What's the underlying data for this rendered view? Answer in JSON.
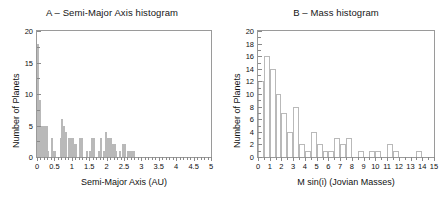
{
  "figure": {
    "width": 448,
    "height": 209,
    "background": "#ffffff",
    "bar_edge_color": "#b9b9b9",
    "axis_color": "#9a9a9a"
  },
  "chart_data": [
    {
      "type": "bar",
      "panel": "A",
      "title": "A – Semi-Major Axis histogram",
      "xlabel": "Semi-Major Axis (AU)",
      "ylabel": "Number of Planets",
      "xlim": [
        0,
        5
      ],
      "ylim": [
        0,
        20
      ],
      "bin_width": 0.05,
      "grid": false,
      "xticks": [
        0,
        0.5,
        1,
        1.5,
        2,
        2.5,
        3,
        3.5,
        4,
        4.5,
        5
      ],
      "xticklabels": [
        "0",
        "0.5",
        "1",
        "1.5",
        "2",
        "2.5",
        "3",
        "3.5",
        "4",
        "4.5",
        "5"
      ],
      "yticks": [
        0,
        5,
        10,
        15,
        20
      ],
      "yticklabels": [
        "0",
        "5",
        "10",
        "15",
        "20"
      ],
      "bin_starts": [
        0.0,
        0.05,
        0.1,
        0.15,
        0.2,
        0.25,
        0.3,
        0.35,
        0.4,
        0.45,
        0.5,
        0.55,
        0.6,
        0.65,
        0.7,
        0.75,
        0.8,
        0.85,
        0.9,
        0.95,
        1.0,
        1.05,
        1.1,
        1.15,
        1.2,
        1.25,
        1.3,
        1.35,
        1.4,
        1.45,
        1.5,
        1.55,
        1.6,
        1.65,
        1.7,
        1.75,
        1.8,
        1.85,
        1.9,
        1.95,
        2.0,
        2.05,
        2.1,
        2.15,
        2.2,
        2.25,
        2.3,
        2.35,
        2.4,
        2.45,
        2.5,
        2.55,
        2.6,
        2.65,
        2.7,
        2.75,
        2.8,
        2.85,
        2.9,
        2.95,
        3.0,
        3.05,
        3.1,
        3.15,
        3.2,
        3.25,
        3.3,
        3.35,
        3.4,
        3.45,
        3.5,
        3.55,
        3.6,
        3.65
      ],
      "values": [
        18,
        9,
        5,
        5,
        5,
        5,
        1,
        0,
        3,
        1,
        1,
        0,
        0,
        3,
        6,
        5,
        4,
        0,
        3,
        3,
        3,
        2,
        2,
        0,
        3,
        3,
        0,
        0,
        1,
        0,
        1,
        3,
        3,
        0,
        0,
        1,
        3,
        0,
        1,
        4,
        3,
        3,
        3,
        2,
        2,
        1,
        0,
        1,
        0,
        2,
        2,
        0,
        1,
        1,
        1,
        1,
        0,
        0,
        0,
        0,
        0,
        0,
        0,
        0,
        0,
        0,
        0,
        0,
        0,
        0,
        0,
        0,
        0,
        0
      ],
      "peak_value": 18,
      "peak_bin": "0.00–0.05"
    },
    {
      "type": "bar",
      "panel": "B",
      "title": "B – Mass histogram",
      "xlabel": "M sin(i) (Jovian Masses)",
      "ylabel": "Number of Planets",
      "xlim": [
        0,
        15
      ],
      "ylim": [
        0,
        20
      ],
      "bin_width": 0.5,
      "grid": false,
      "xticks": [
        0,
        1,
        2,
        3,
        4,
        5,
        6,
        7,
        8,
        9,
        10,
        11,
        12,
        13,
        14,
        15
      ],
      "xticklabels": [
        "0",
        "1",
        "2",
        "3",
        "4",
        "5",
        "6",
        "7",
        "8",
        "9",
        "10",
        "11",
        "12",
        "13",
        "14",
        "15"
      ],
      "yticks": [
        0,
        2,
        4,
        6,
        8,
        10,
        12,
        14,
        16,
        18,
        20
      ],
      "yticklabels": [
        "0",
        "2",
        "4",
        "6",
        "8",
        "10",
        "12",
        "14",
        "16",
        "18",
        "20"
      ],
      "bin_starts": [
        0.0,
        0.5,
        1.0,
        1.5,
        2.0,
        2.5,
        3.0,
        3.5,
        4.0,
        4.5,
        5.0,
        5.5,
        6.0,
        6.5,
        7.0,
        7.5,
        8.0,
        8.5,
        9.0,
        9.5,
        10.0,
        10.5,
        11.0,
        11.5,
        12.0,
        12.5,
        13.0,
        13.5,
        14.0,
        14.5
      ],
      "values": [
        12,
        16,
        14,
        10,
        7,
        4,
        8,
        2,
        1,
        4,
        2,
        1,
        1,
        3,
        2,
        3,
        0,
        1,
        0,
        1,
        1,
        0,
        2,
        1,
        0,
        0,
        0,
        1,
        0,
        0
      ],
      "peak_value": 16,
      "peak_bin": "0.5–1.0"
    }
  ]
}
